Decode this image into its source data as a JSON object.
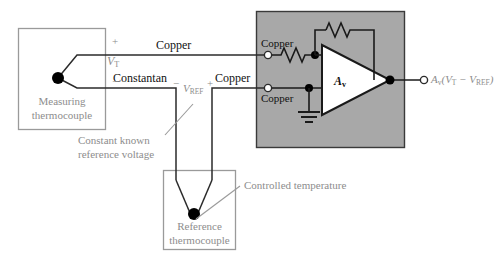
{
  "figure": {
    "type": "circuit-schematic"
  },
  "boxes": {
    "measuring_thermocouple": {
      "label_line1": "Measuring",
      "label_line2": "thermocouple"
    },
    "reference_thermocouple": {
      "label_line1": "Reference",
      "label_line2": "thermocouple"
    },
    "amplifier_enclosure": {
      "fill": "#a8a8a8",
      "border": "#3a3a3a"
    }
  },
  "wire_labels": {
    "copper_top": "Copper",
    "constantan": "Constantan",
    "copper_mid": "Copper",
    "copper_amp_top": "Copper",
    "copper_amp_bottom": "Copper"
  },
  "voltages": {
    "vt": "V",
    "vt_sub": "T",
    "vt_plus": "+",
    "vt_minus": "−",
    "vref": "V",
    "vref_sub": "REF",
    "vref_minus": "−",
    "vref_plus": "+"
  },
  "amplifier": {
    "gain_symbol": "A",
    "gain_sub": "v"
  },
  "output": {
    "expression_prefix": "A",
    "expression_sub": "v",
    "expression_body": "(V",
    "expression_sub2": "T",
    "expression_mid": " − V",
    "expression_sub3": "REF",
    "expression_end": ")",
    "full_text": "Av(VT − VREF)"
  },
  "annotations": {
    "constant_known_line1": "Constant known",
    "constant_known_line2": "reference voltage",
    "controlled_temperature": "Controlled temperature"
  },
  "colors": {
    "wire": "#2b2b2b",
    "box_outline": "#9a9a9a",
    "gray_text": "#8d8d8d",
    "enclosure_fill": "#a8a8a8",
    "enclosure_stroke": "#3a3a3a",
    "node_dot": "#000000",
    "terminal_fill": "#ffffff"
  },
  "components": {
    "input_resistor": "resistor-zigzag",
    "feedback_resistor": "resistor-zigzag",
    "ground": "ground-symbol",
    "junction_measuring": "junction-dot",
    "junction_reference": "junction-dot"
  }
}
